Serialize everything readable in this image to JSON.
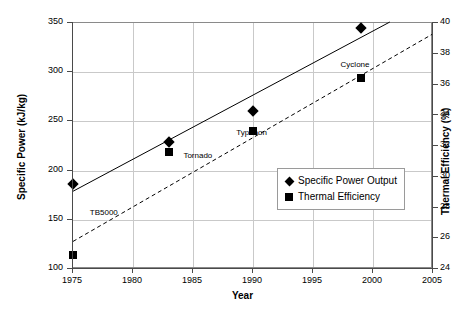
{
  "chart_data": {
    "type": "scatter",
    "title": "",
    "xlabel": "Year",
    "ylabel": "Specific Power (kJ/kg)",
    "y2label": "Thermal Efficiency (%)",
    "xlim": [
      1975,
      2005
    ],
    "ylim": [
      100,
      350
    ],
    "y2lim": [
      24,
      40
    ],
    "xticks": [
      "1975",
      "1980",
      "1985",
      "1990",
      "1995",
      "2000",
      "2005"
    ],
    "yticks": [
      "100",
      "150",
      "200",
      "250",
      "300",
      "350"
    ],
    "y2ticks": [
      "24",
      "26",
      "28",
      "30",
      "32",
      "34",
      "36",
      "38",
      "40"
    ],
    "grid": true,
    "legend_position": "inside-lower-right",
    "series": [
      {
        "name": "Specific Power Output",
        "marker": "diamond",
        "axis": "left",
        "trendline": "solid",
        "x": [
          1975,
          1983,
          1990,
          1999
        ],
        "values": [
          186,
          229,
          261,
          345
        ]
      },
      {
        "name": "Thermal Efficiency",
        "marker": "square",
        "axis": "right",
        "trendline": "dashed",
        "x": [
          1975,
          1983,
          1990,
          1999
        ],
        "values": [
          24.9,
          31.6,
          33.0,
          36.4
        ]
      }
    ],
    "annotations": [
      {
        "text": "TB5000",
        "x": 1976.4,
        "y_left": 157
      },
      {
        "text": "Tornado",
        "x": 1984.2,
        "y_left": 215
      },
      {
        "text": "Typhoon",
        "x": 1988.6,
        "y_left": 238
      },
      {
        "text": "Cyclone",
        "x": 1997.3,
        "y_left": 307
      }
    ],
    "trendlines": [
      {
        "name": "Specific Power Output",
        "style": "solid",
        "x0": 1975,
        "y0": 179,
        "x1": 2001.4,
        "y1": 351
      },
      {
        "name": "Thermal Efficiency",
        "style": "dashed",
        "x0": 1975,
        "y0": 128,
        "x1": 2005,
        "y1": 339
      }
    ]
  },
  "legend": {
    "items": [
      {
        "label": "Specific Power Output",
        "marker": "diamond"
      },
      {
        "label": "Thermal Efficiency",
        "marker": "square"
      }
    ]
  },
  "colors": {
    "series": "#000000",
    "grid": "#c9c9c9",
    "axis": "#4a4a4a",
    "background": "#ffffff"
  }
}
